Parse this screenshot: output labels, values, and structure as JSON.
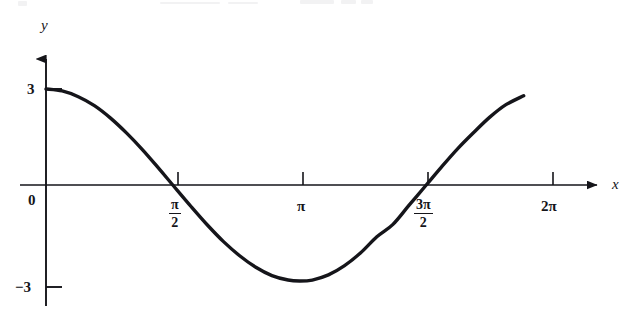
{
  "figure": {
    "kind": "scanned-textbook-graph",
    "background_color": "#ffffff",
    "ink_color": "#15151a"
  },
  "axes": {
    "x_axis_label": "x",
    "y_axis_label": "y",
    "origin_label": "0"
  },
  "y_ticks": [
    {
      "value": 3,
      "label": "3"
    },
    {
      "value": -3,
      "label": "−3"
    }
  ],
  "x_ticks": [
    {
      "value": 1.5707963,
      "label_type": "fraction",
      "numerator": "π",
      "denominator": "2",
      "plain": "π/2"
    },
    {
      "value": 3.1415927,
      "label_type": "plain",
      "plain": "π"
    },
    {
      "value": 4.712389,
      "label_type": "fraction",
      "numerator": "3π",
      "denominator": "2",
      "plain": "3π/2"
    },
    {
      "value": 6.2831853,
      "label_type": "plain",
      "plain": "2π"
    }
  ],
  "chart_data": {
    "type": "line",
    "title": "",
    "subtitle": "",
    "xlabel": "x",
    "ylabel": "y",
    "xlim": [
      0,
      6.6
    ],
    "ylim": [
      -3.6,
      3.6
    ],
    "grid": false,
    "legend": null,
    "series": [
      {
        "name": "y = 3 cos(x)",
        "expression": "3*cos(x)",
        "stroke_color": "#15151a",
        "stroke_width": 3.4,
        "x_start": 0.0,
        "x_end": 5.92,
        "x": [
          0.0,
          0.2,
          0.4,
          0.6,
          0.8,
          1.0,
          1.2,
          1.4,
          1.5707963,
          1.8,
          2.0,
          2.2,
          2.4,
          2.6,
          2.8,
          3.0,
          3.1415927,
          3.3,
          3.5,
          3.7,
          3.9,
          4.1,
          4.3,
          4.5,
          4.712389,
          4.9,
          5.1,
          5.3,
          5.5,
          5.7,
          5.92
        ],
        "y": [
          3.0,
          2.94,
          2.76,
          2.48,
          2.09,
          1.62,
          1.09,
          0.51,
          0.0,
          -0.68,
          -1.25,
          -1.77,
          -2.21,
          -2.57,
          -2.83,
          -2.97,
          -3.0,
          -2.97,
          -2.81,
          -2.52,
          -2.12,
          -1.62,
          -1.23,
          -0.63,
          0.0,
          0.56,
          1.13,
          1.64,
          2.12,
          2.51,
          2.79
        ]
      }
    ],
    "annotations": [
      {
        "text": "3",
        "at_x": 0,
        "at_y": 3,
        "role": "y-tick-label"
      },
      {
        "text": "0",
        "at_x": 0,
        "at_y": 0,
        "role": "origin-label"
      },
      {
        "text": "−3",
        "at_x": 0,
        "at_y": -3,
        "role": "y-tick-label"
      },
      {
        "text": "π/2",
        "at_x": 1.5707963,
        "at_y": 0,
        "role": "x-tick-label"
      },
      {
        "text": "π",
        "at_x": 3.1415927,
        "at_y": 0,
        "role": "x-tick-label"
      },
      {
        "text": "3π/2",
        "at_x": 4.712389,
        "at_y": 0,
        "role": "x-tick-label"
      },
      {
        "text": "2π",
        "at_x": 6.2831853,
        "at_y": 0,
        "role": "x-tick-label"
      }
    ]
  }
}
